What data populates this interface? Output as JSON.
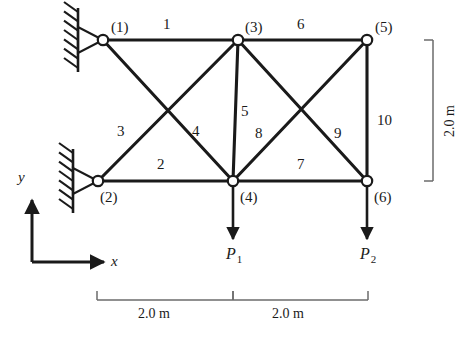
{
  "figure": {
    "type": "structural-truss-diagram",
    "colors": {
      "line": "#1a1a1a",
      "node_fill": "#ffffff",
      "text": "#1a1a1a",
      "dim_line": "#6b6b6b",
      "background": "#ffffff"
    }
  },
  "nodes": [
    {
      "id": "1",
      "label": "(1)",
      "x": 103,
      "y": 40,
      "support": "pin"
    },
    {
      "id": "2",
      "label": "(2)",
      "x": 98,
      "y": 181,
      "support": "pin"
    },
    {
      "id": "3",
      "label": "(3)",
      "x": 238,
      "y": 40,
      "support": "none"
    },
    {
      "id": "4",
      "label": "(4)",
      "x": 233,
      "y": 181,
      "support": "none"
    },
    {
      "id": "5",
      "label": "(5)",
      "x": 367,
      "y": 40,
      "support": "none"
    },
    {
      "id": "6",
      "label": "(6)",
      "x": 367,
      "y": 181,
      "support": "none"
    }
  ],
  "members": [
    {
      "id": "1",
      "label": "1",
      "from": "1",
      "to": "3",
      "lx": 163,
      "ly": 17
    },
    {
      "id": "2",
      "label": "2",
      "from": "2",
      "to": "4",
      "lx": 157,
      "ly": 157
    },
    {
      "id": "3",
      "label": "3",
      "from": "2",
      "to": "3",
      "lx": 117,
      "ly": 124
    },
    {
      "id": "4",
      "label": "4",
      "from": "1",
      "to": "4",
      "lx": 192,
      "ly": 124
    },
    {
      "id": "5",
      "label": "5",
      "from": "3",
      "to": "4",
      "lx": 241,
      "ly": 104
    },
    {
      "id": "6",
      "label": "6",
      "from": "3",
      "to": "5",
      "lx": 297,
      "ly": 17
    },
    {
      "id": "7",
      "label": "7",
      "from": "4",
      "to": "6",
      "lx": 297,
      "ly": 157
    },
    {
      "id": "8",
      "label": "8",
      "from": "3",
      "to": "6",
      "lx": 255,
      "ly": 126
    },
    {
      "id": "9",
      "label": "9",
      "from": "5",
      "to": "4",
      "lx": 334,
      "ly": 126
    },
    {
      "id": "10",
      "label": "10",
      "from": "5",
      "to": "6",
      "lx": 377,
      "ly": 113
    }
  ],
  "loads": [
    {
      "id": "P1",
      "label": "P",
      "subscript": "1",
      "at_node": "4",
      "x": 233,
      "y": 181,
      "length": 58,
      "direction": "down",
      "lx": 226,
      "ly": 246
    },
    {
      "id": "P2",
      "label": "P",
      "subscript": "2",
      "at_node": "6",
      "x": 367,
      "y": 181,
      "length": 58,
      "direction": "down",
      "lx": 360,
      "ly": 246
    }
  ],
  "supports": [
    {
      "node": "1",
      "kind": "pin-on-wall",
      "wall_x": 78,
      "wall_y_top": 8,
      "wall_y_bottom": 72
    },
    {
      "node": "2",
      "kind": "pin-on-wall",
      "wall_x": 73,
      "wall_y_top": 149,
      "wall_y_bottom": 213
    }
  ],
  "dimensions": {
    "horizontal": [
      {
        "label": "2.0 m",
        "from_x": 97,
        "to_x": 233,
        "y": 300,
        "lx": 138,
        "ly": 307
      },
      {
        "label": "2.0 m",
        "from_x": 233,
        "to_x": 368,
        "y": 300,
        "lx": 272,
        "ly": 307
      }
    ],
    "vertical": [
      {
        "label": "2.0 m",
        "x": 433,
        "from_y": 40,
        "to_y": 181,
        "lx": 443,
        "ly": 137
      }
    ]
  },
  "axes": {
    "origin": {
      "x": 32,
      "y": 262
    },
    "x_axis": {
      "label": "x",
      "length": 72,
      "lx": 111,
      "ly": 254
    },
    "y_axis": {
      "label": "y",
      "length": 62,
      "lx": 18,
      "ly": 170
    }
  }
}
